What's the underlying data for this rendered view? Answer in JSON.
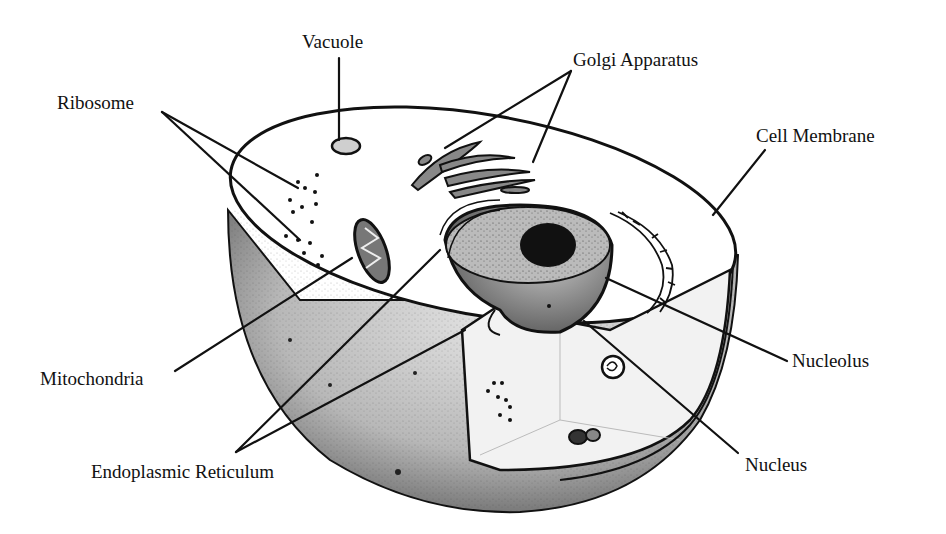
{
  "diagram": {
    "colors": {
      "background": "#ffffff",
      "ink": "#111111",
      "shade_dark": "#3a3a3a",
      "shade_mid": "#9a9a9a",
      "shade_light": "#d6d6d6"
    },
    "labels": [
      {
        "id": "vacuole",
        "text": "Vacuole",
        "x": 302,
        "y": 32
      },
      {
        "id": "golgi",
        "text": "Golgi Apparatus",
        "x": 573,
        "y": 50
      },
      {
        "id": "ribosome",
        "text": "Ribosome",
        "x": 57,
        "y": 93
      },
      {
        "id": "cell-membrane",
        "text": "Cell Membrane",
        "x": 756,
        "y": 126
      },
      {
        "id": "mitochondria",
        "text": "Mitochondria",
        "x": 40,
        "y": 369
      },
      {
        "id": "nucleolus",
        "text": "Nucleolus",
        "x": 792,
        "y": 351
      },
      {
        "id": "nucleus",
        "text": "Nucleus",
        "x": 745,
        "y": 455
      },
      {
        "id": "endoplasmic-reticulum",
        "text": "Endoplasmic Reticulum",
        "x": 91,
        "y": 462
      }
    ]
  }
}
